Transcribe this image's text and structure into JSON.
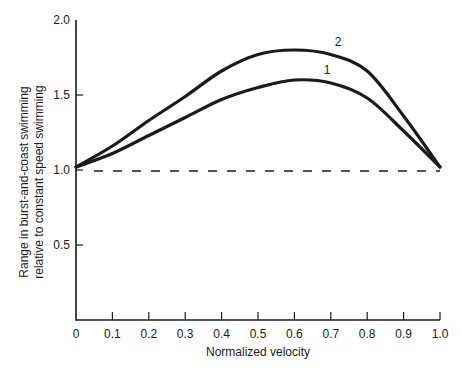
{
  "chart_data": {
    "type": "line",
    "title": "",
    "xlabel": "Normalized velocity",
    "ylabel": "Range in burst-and-coast swimming relative to constant speed swimming",
    "ylabel_lines": [
      "Range in burst-and-coast swimming",
      "relative to constant speed swimming"
    ],
    "xlim": [
      0,
      1.0
    ],
    "ylim": [
      0,
      2.0
    ],
    "x_ticks": [
      "0",
      "0.1",
      "0.2",
      "0.3",
      "0.4",
      "0.5",
      "0.6",
      "0.7",
      "0.8",
      "0.9",
      "1.0"
    ],
    "y_ticks": [
      "0.5",
      "1.0",
      "1.5",
      "2.0"
    ],
    "grid": false,
    "legend": "inline curve labels",
    "x": [
      0,
      0.1,
      0.2,
      0.3,
      0.4,
      0.5,
      0.6,
      0.7,
      0.8,
      0.9,
      1.0
    ],
    "series": [
      {
        "name": "1",
        "values": [
          1.02,
          1.11,
          1.23,
          1.35,
          1.47,
          1.55,
          1.6,
          1.58,
          1.48,
          1.26,
          1.02
        ]
      },
      {
        "name": "2",
        "values": [
          1.02,
          1.16,
          1.33,
          1.49,
          1.66,
          1.77,
          1.8,
          1.77,
          1.66,
          1.36,
          1.02
        ]
      }
    ],
    "reference_line": {
      "y": 1.0,
      "style": "dashed"
    },
    "annotations": [
      {
        "text": "1",
        "x": 0.69,
        "y": 1.64
      },
      {
        "text": "2",
        "x": 0.72,
        "y": 1.83
      }
    ]
  }
}
